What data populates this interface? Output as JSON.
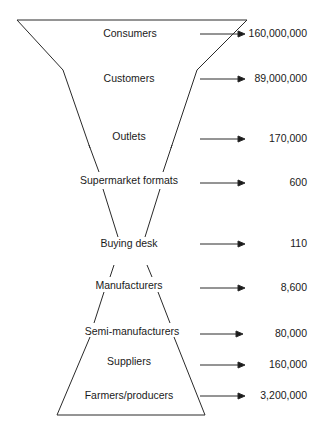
{
  "diagram": {
    "type": "funnel-hourglass",
    "levels": [
      {
        "label": "Consumers",
        "value": "160,000,000",
        "y": 34
      },
      {
        "label": "Customers",
        "value": "89,000,000",
        "y": 79
      },
      {
        "label": "Outlets",
        "value": "170,000",
        "y": 139
      },
      {
        "label": "Supermarket formats",
        "value": "600",
        "y": 182
      },
      {
        "label": "Buying desk",
        "value": "110",
        "y": 245
      },
      {
        "label": "Manufacturers",
        "value": "8,600",
        "y": 287
      },
      {
        "label": "Semi-manufacturers",
        "value": "80,000",
        "y": 333
      },
      {
        "label": "Suppliers",
        "value": "160,000",
        "y": 363
      },
      {
        "label": "Farmers/producers",
        "value": "3,200,000",
        "y": 396
      }
    ],
    "line_color": "#2a2a2a",
    "text_color": "#1a1a1a"
  }
}
